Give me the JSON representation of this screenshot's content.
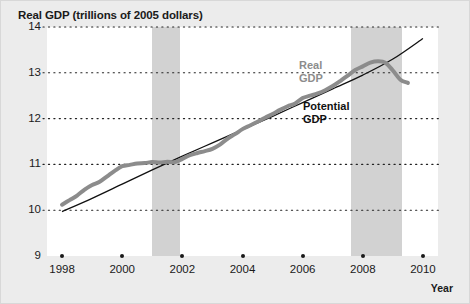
{
  "figure": {
    "title": "Real GDP (trillions of 2005 dollars)",
    "x_axis_title": "Year",
    "background_color": "#ececec",
    "plot_background_color": "#ffffff",
    "recession_band_color": "#d2d2d2"
  },
  "chart_data": {
    "type": "line",
    "title": "Real GDP (trillions of 2005 dollars)",
    "xlabel": "Year",
    "ylabel": "Real GDP (trillions of 2005 dollars)",
    "xlim": [
      1997.5,
      2010.5
    ],
    "ylim": [
      9,
      14
    ],
    "y_ticks": [
      9,
      10,
      11,
      12,
      13,
      14
    ],
    "y_tick_labels": [
      "9",
      "10",
      "11",
      "12",
      "13",
      "14"
    ],
    "x_ticks": [
      1998,
      2000,
      2002,
      2004,
      2006,
      2008,
      2010
    ],
    "x_tick_labels": [
      "1998",
      "2000",
      "2002",
      "2004",
      "2006",
      "2008",
      "2010"
    ],
    "grid": "horizontal-dotted",
    "legend_position": "inline-annotations",
    "series": [
      {
        "name": "Real GDP",
        "color": "#8c8c8c",
        "line_width": 4,
        "x": [
          1998.0,
          1998.25,
          1998.5,
          1998.75,
          1999.0,
          1999.25,
          1999.5,
          1999.75,
          2000.0,
          2000.25,
          2000.5,
          2000.75,
          2001.0,
          2001.25,
          2001.5,
          2001.75,
          2002.0,
          2002.25,
          2002.5,
          2002.75,
          2003.0,
          2003.25,
          2003.5,
          2003.75,
          2004.0,
          2004.25,
          2004.5,
          2004.75,
          2005.0,
          2005.25,
          2005.5,
          2005.75,
          2006.0,
          2006.25,
          2006.5,
          2006.75,
          2007.0,
          2007.25,
          2007.5,
          2007.75,
          2008.0,
          2008.25,
          2008.5,
          2008.75,
          2009.0,
          2009.25,
          2009.5
        ],
        "y": [
          10.12,
          10.22,
          10.32,
          10.45,
          10.55,
          10.62,
          10.74,
          10.86,
          10.96,
          10.99,
          11.02,
          11.03,
          11.05,
          11.04,
          11.06,
          11.05,
          11.12,
          11.2,
          11.25,
          11.29,
          11.34,
          11.43,
          11.56,
          11.66,
          11.77,
          11.85,
          11.93,
          12.02,
          12.1,
          12.19,
          12.27,
          12.33,
          12.45,
          12.5,
          12.55,
          12.62,
          12.71,
          12.82,
          12.94,
          13.06,
          13.14,
          13.22,
          13.25,
          13.22,
          13.05,
          12.85,
          12.78
        ]
      },
      {
        "name": "Potential GDP",
        "color": "#111111",
        "line_width": 1.3,
        "x": [
          1998.0,
          1999.0,
          2000.0,
          2001.0,
          2002.0,
          2003.0,
          2004.0,
          2005.0,
          2006.0,
          2007.0,
          2008.0,
          2009.0,
          2010.0
        ],
        "y": [
          9.97,
          10.26,
          10.57,
          10.88,
          11.18,
          11.47,
          11.76,
          12.05,
          12.35,
          12.65,
          12.95,
          13.3,
          13.75
        ]
      }
    ],
    "recession_bands": [
      {
        "start": 2001.0,
        "end": 2001.92,
        "label": "recession-band-2001"
      },
      {
        "start": 2007.6,
        "end": 2009.3,
        "label": "recession-band-2008"
      }
    ],
    "annotations": [
      {
        "name": "real-gdp-label",
        "text": "Real\nGDP",
        "color": "#8c8c8c"
      },
      {
        "name": "potential-gdp-label",
        "text": "Potential\nGDP",
        "color": "#111111"
      }
    ]
  }
}
